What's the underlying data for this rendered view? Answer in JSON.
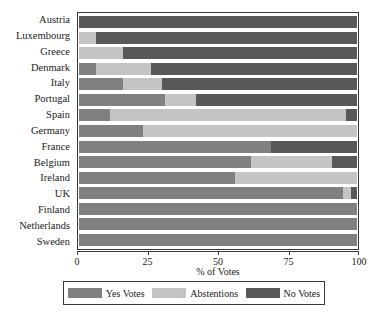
{
  "figure": {
    "clipped_title": "of Votes by Country"
  },
  "chart_data": {
    "type": "bar",
    "orientation": "horizontal",
    "stacked": true,
    "stack_total": 100,
    "title": "",
    "xlabel": "% of Votes",
    "ylabel": "",
    "xlim": [
      0,
      100
    ],
    "xticks": [
      0,
      25,
      50,
      75,
      100
    ],
    "xticklabels": [
      "0",
      "25",
      "50",
      "75",
      "100"
    ],
    "grid": false,
    "legend_position": "bottom",
    "categories": [
      "Austria",
      "Luxembourg",
      "Greece",
      "Denmark",
      "Italy",
      "Portugal",
      "Spain",
      "Germany",
      "France",
      "Belgium",
      "Ireland",
      "UK",
      "Finland",
      "Netherlands",
      "Sweden"
    ],
    "series": [
      {
        "name": "Yes Votes",
        "color": "#808080",
        "values": [
          0,
          0,
          0,
          6,
          16,
          31,
          11,
          23,
          69,
          62,
          56,
          95,
          100,
          100,
          100
        ]
      },
      {
        "name": "Abstentions",
        "color": "#c4c4c4",
        "values": [
          0,
          6,
          16,
          20,
          14,
          11,
          85,
          77,
          0,
          29,
          44,
          3,
          0,
          0,
          0
        ]
      },
      {
        "name": "No Votes",
        "color": "#585858",
        "values": [
          100,
          94,
          84,
          74,
          70,
          58,
          4,
          0,
          31,
          9,
          0,
          2,
          0,
          0,
          0
        ]
      }
    ],
    "legend": [
      {
        "label": "Yes Votes",
        "color": "#808080"
      },
      {
        "label": "Abstentions",
        "color": "#c4c4c4"
      },
      {
        "label": "No Votes",
        "color": "#585858"
      }
    ]
  }
}
